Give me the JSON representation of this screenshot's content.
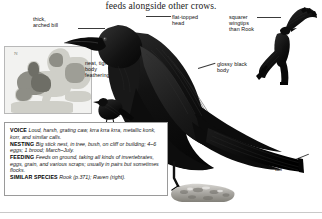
{
  "page": {
    "caption": "feeds alongside other crows.",
    "background": "#ffffff"
  },
  "labels": {
    "thick_arched_bill": "thick,\narched bill",
    "flat_topped_head": "flat-topped\nhead",
    "squarer_wingtips": "squarer\nwingtips\nthan Rook",
    "neat_tight_body_feathering": "neat, tight\nbody\nfeathering",
    "glossy_black_body": "glossy black\nbody",
    "square_tail": "square\ntail"
  },
  "map": {
    "name": "range-map-europe",
    "compass": "N",
    "sea_color": "#f2f2f0",
    "land_color": "#cfcfc8",
    "range_color": "#8e8e86"
  },
  "info": {
    "voice_heading": "VOICE",
    "voice_text": "Loud, harsh, grating caw, krra krra krra, metallic konk, korr, and similar calls.",
    "nesting_heading": "NESTING",
    "nesting_text": "Big stick nest, in tree, bush, on cliff or building; 4–6 eggs; 1 brood; March–July.",
    "feeding_heading": "FEEDING",
    "feeding_text": "Feeds on ground, taking all kinds of invertebrates, eggs, grain, and various scraps; usually in pairs but sometimes flocks.",
    "similar_heading": "SIMILAR SPECIES",
    "similar_text": "Rook (p.371); Raven (right)."
  },
  "illustrations": {
    "perched_crow": "perched-crow-illustration",
    "flying_crow": "flying-crow-illustration",
    "small_perched_crow": "small-perched-crow-illustration",
    "perch_rock": "perch-rock-illustration",
    "bird_color": "#141414"
  }
}
